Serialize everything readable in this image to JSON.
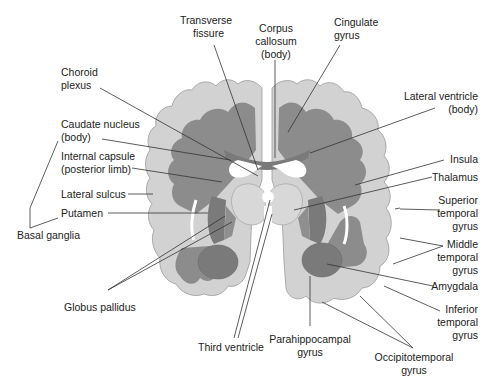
{
  "diagram": {
    "colors": {
      "gray_matter": "#d2d2d2",
      "white_matter": "#8c8c8c",
      "deep_nuclei": "#7a7a7a",
      "ventricle": "#ffffff",
      "outline": "#9a9a9a",
      "leader_line": "#333333",
      "text": "#222222"
    },
    "labels": {
      "transverse_fissure": [
        "Transverse",
        "fissure"
      ],
      "corpus_callosum": [
        "Corpus",
        "callosum",
        "(body)"
      ],
      "cingulate_gyrus": [
        "Cingulate",
        "gyrus"
      ],
      "choroid_plexus": [
        "Choroid",
        "plexus"
      ],
      "lateral_ventricle": [
        "Lateral ventricle",
        "(body)"
      ],
      "caudate_nucleus": [
        "Caudate nucleus",
        "(body)"
      ],
      "internal_capsule": [
        "Internal capsule",
        "(posterior limb)"
      ],
      "insula": "Insula",
      "thalamus": "Thalamus",
      "lateral_sulcus": "Lateral sulcus",
      "putamen": "Putamen",
      "basal_ganglia": "Basal ganglia",
      "superior_temporal_gyrus": [
        "Superior",
        "temporal",
        "gyrus"
      ],
      "middle_temporal_gyrus": [
        "Middle",
        "temporal",
        "gyrus"
      ],
      "amygdala": "Amygdala",
      "inferior_temporal_gyrus": [
        "Inferior",
        "temporal",
        "gyrus"
      ],
      "globus_pallidus": "Globus pallidus",
      "third_ventricle": "Third ventricle",
      "parahippocampal_gyrus": [
        "Parahippocampal",
        "gyrus"
      ],
      "occipitotemporal_gyrus": [
        "Occipitotemporal",
        "gyrus"
      ]
    }
  }
}
